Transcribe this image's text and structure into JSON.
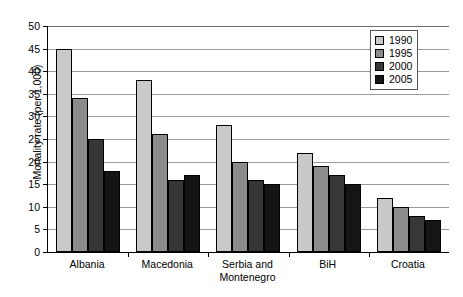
{
  "chart_data": {
    "type": "bar",
    "title": "",
    "xlabel": "",
    "ylabel": "Mortality rate (per 1,000)",
    "ylim": [
      0,
      50
    ],
    "ytick_step": 5,
    "yticks": [
      "0",
      "5",
      "10",
      "15",
      "20",
      "25",
      "30",
      "35",
      "40",
      "45",
      "50"
    ],
    "grid": true,
    "legend_position": "top-right",
    "categories": [
      "Albania",
      "Macedonia",
      "Serbia and\nMontenegro",
      "BiH",
      "Croatia"
    ],
    "series": [
      {
        "name": "1990",
        "color": "#c9c9c9",
        "values": [
          45,
          38,
          28,
          22,
          12
        ]
      },
      {
        "name": "1995",
        "color": "#8c8c8c",
        "values": [
          34,
          26,
          20,
          19,
          10
        ]
      },
      {
        "name": "2000",
        "color": "#373737",
        "values": [
          25,
          16,
          16,
          17,
          8
        ]
      },
      {
        "name": "2005",
        "color": "#151515",
        "values": [
          18,
          17,
          15,
          15,
          7
        ]
      }
    ]
  },
  "axis": {
    "y_title": "Mortality rate (per 1,000)"
  },
  "categories_display": [
    {
      "line1": "Albania",
      "line2": ""
    },
    {
      "line1": "Macedonia",
      "line2": ""
    },
    {
      "line1": "Serbia and",
      "line2": "Montenegro"
    },
    {
      "line1": "BiH",
      "line2": ""
    },
    {
      "line1": "Croatia",
      "line2": ""
    }
  ],
  "legend": {
    "items": [
      {
        "label": "1990"
      },
      {
        "label": "1995"
      },
      {
        "label": "2000"
      },
      {
        "label": "2005"
      }
    ]
  }
}
